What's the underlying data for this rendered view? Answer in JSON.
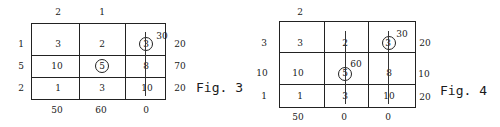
{
  "fig3": {
    "caption": "Fig. 3",
    "col_potentials": [
      "2",
      "1",
      ""
    ],
    "row_potentials": [
      "1",
      "5",
      "2"
    ],
    "cells": [
      [
        "3",
        "2",
        "3"
      ],
      [
        "10",
        "5",
        "8"
      ],
      [
        "1",
        "3",
        "10"
      ]
    ],
    "supply": [
      "20",
      "70",
      "20"
    ],
    "demand": [
      "50",
      "60",
      "0"
    ],
    "circled_cells": [
      [
        0,
        2
      ],
      [
        1,
        1
      ]
    ],
    "allocation_label": "30"
  },
  "fig4": {
    "caption": "Fig. 4",
    "col_potentials": [
      "2",
      "",
      ""
    ],
    "row_potentials": [
      "3",
      "10",
      "1"
    ],
    "cells": [
      [
        "3",
        "2",
        "3"
      ],
      [
        "10",
        "5",
        "8"
      ],
      [
        "1",
        "3",
        "10"
      ]
    ],
    "supply": [
      "20",
      "10",
      "20"
    ],
    "demand": [
      "50",
      "0",
      "0"
    ],
    "circled_cells": [
      [
        0,
        2
      ],
      [
        1,
        1
      ]
    ],
    "allocation_labels": [
      "30",
      "60"
    ]
  }
}
